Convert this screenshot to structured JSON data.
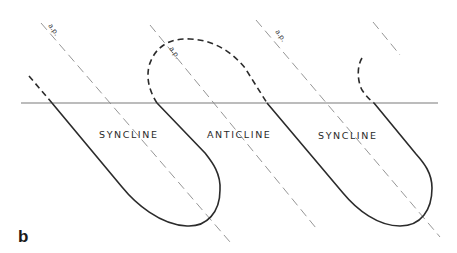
{
  "figure": {
    "panel_label": "b",
    "labels": {
      "syncline_left": "SYNCLINE",
      "anticline": "ANTICLINE",
      "syncline_right": "SYNCLINE"
    },
    "axial_plane_label": "a.p.",
    "colors": {
      "fold_line": "#2b2b2b",
      "axial_plane": "#8a8a8a",
      "ground_surface": "#7a7a7a"
    }
  }
}
